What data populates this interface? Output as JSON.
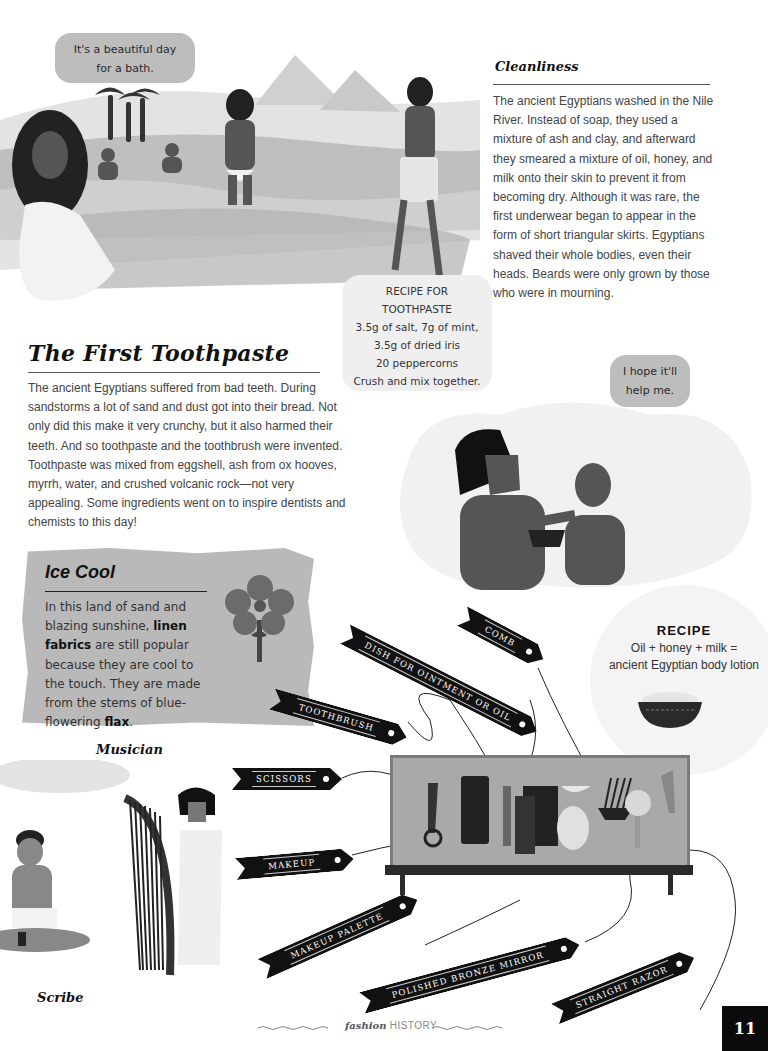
{
  "page": {
    "number": "11",
    "footer": {
      "brand_italic": "fashion",
      "brand_caps": "HISTORY"
    }
  },
  "illustrations": {
    "bath_scene": {
      "speech": [
        "It's a beautiful day",
        "for a bath."
      ]
    },
    "toothpaste_recipe": {
      "lines": [
        "RECIPE FOR",
        "TOOTHPASTE",
        "3.5g of salt, 7g of mint,",
        "3.5g of dried iris",
        "20 peppercorns",
        "Crush and mix together."
      ]
    },
    "dentist_scene": {
      "speech": [
        "I hope it'll",
        "help me."
      ]
    }
  },
  "cleanliness": {
    "title": "Cleanliness",
    "text": "The ancient Egyptians washed in the Nile River. Instead of soap, they used a mixture of ash and clay, and afterward they smeared a mixture of oil, honey, and milk onto their skin to prevent it from becoming dry. Although it was rare, the first underwear began to appear in the form of short triangular skirts. Egyptians shaved their whole bodies, even their heads. Beards were only grown by those who were in mourning."
  },
  "first_toothpaste": {
    "title": "The First Toothpaste",
    "text": "The ancient Egyptians suffered from bad teeth. During sandstorms a lot of sand and dust got into their bread. Not only did this make it very crunchy, but it also harmed their teeth. And so toothpaste and the toothbrush were invented. Toothpaste was mixed from eggshell, ash from ox hooves, myrrh, water, and crushed volcanic rock—not very appealing. Some ingredients went on to inspire dentists and chemists to this day!"
  },
  "ice_cool": {
    "title": "Ice Cool",
    "text_parts": [
      "In this land of sand and blazing sunshine, ",
      "linen fabrics",
      " are still popular because they are cool to the touch. They are made from the stems of blue-flowering ",
      "flax",
      "."
    ]
  },
  "lotion_recipe": {
    "title": "RECIPE",
    "lines": [
      "Oil + honey + milk =",
      "ancient Egyptian body lotion"
    ]
  },
  "captions": {
    "musician": "Musician",
    "scribe": "Scribe"
  },
  "labels": {
    "comb": "COMB",
    "dish": "DISH FOR OINTMENT OR OIL",
    "toothbrush": "TOOTHBRUSH",
    "scissors": "SCISSORS",
    "makeup": "MAKEUP",
    "makeup_palette": "MAKEUP PALETTE",
    "mirror": "POLISHED BRONZE MIRROR",
    "razor": "STRAIGHT RAZOR"
  },
  "colors": {
    "ink": "#111111",
    "body_text": "#444444",
    "bubble": "#bdbdbd",
    "paper": "#ffffff",
    "ribbon": "#111111"
  }
}
